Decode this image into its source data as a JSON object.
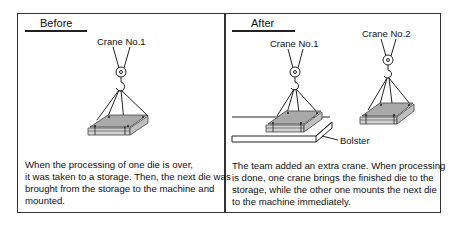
{
  "before": {
    "heading": "Before",
    "crane_label": "Crane No.1",
    "caption_lines": [
      "When the processing of one die is over,",
      "it was taken to a storage. Then, the next die was",
      "brought from the storage to the machine and",
      "mounted."
    ]
  },
  "after": {
    "heading": "After",
    "crane1_label": "Crane No.1",
    "crane2_label": "Crane No.2",
    "bolster_label": "Bolster",
    "caption_lines": [
      "The team added an extra crane. When processing",
      "is done, one crane brings the finished die to the",
      "storage, while the other one mounts the next die",
      "to the machine immediately."
    ]
  },
  "colors": {
    "line": "#222222",
    "die_fill": "#a9a9a9",
    "die_edge": "#555555"
  }
}
